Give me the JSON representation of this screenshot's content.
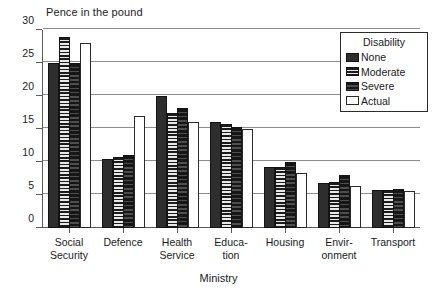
{
  "chart_data": {
    "type": "bar",
    "title": "",
    "ylabel": "Pence in the pound",
    "xlabel": "Ministry",
    "ylim": [
      0,
      30
    ],
    "yticks": [
      0,
      5,
      10,
      15,
      20,
      25,
      30
    ],
    "grid": true,
    "legend_title": "Disability",
    "legend_position": "top-right-inside",
    "categories": [
      "Social Security",
      "Defence",
      "Health Service",
      "Education",
      "Housing",
      "Environment",
      "Transport"
    ],
    "category_lines": [
      [
        "Social",
        "Security"
      ],
      [
        "Defence",
        ""
      ],
      [
        "Health",
        "Service"
      ],
      [
        "Educa-",
        "tion"
      ],
      [
        "Housing",
        ""
      ],
      [
        "Envir-",
        "onment"
      ],
      [
        "Transport",
        ""
      ]
    ],
    "series": [
      {
        "name": "None",
        "values": [
          25.0,
          10.5,
          20.0,
          16.0,
          9.2,
          6.8,
          5.7
        ]
      },
      {
        "name": "Moderate",
        "values": [
          29.0,
          10.8,
          17.5,
          15.7,
          9.2,
          7.0,
          5.8
        ]
      },
      {
        "name": "Severe",
        "values": [
          25.0,
          11.0,
          18.2,
          15.3,
          10.0,
          8.0,
          5.9
        ]
      },
      {
        "name": "Actual",
        "values": [
          28.0,
          17.0,
          16.0,
          15.0,
          8.3,
          6.3,
          5.6
        ]
      }
    ]
  },
  "legend": {
    "title": "Disability",
    "items": [
      {
        "label": "None"
      },
      {
        "label": "Moderate"
      },
      {
        "label": "Severe"
      },
      {
        "label": "Actual"
      }
    ]
  },
  "axes": {
    "y_title": "Pence in the pound",
    "x_title": "Ministry",
    "y_tick_labels": [
      "30",
      "25",
      "20",
      "15",
      "10",
      "5",
      "0"
    ]
  },
  "colors": {
    "series_none": "#2e2e2e",
    "series_moderate": "#bdbdbd",
    "series_severe": "#3a3a3a",
    "series_actual": "#ffffff",
    "axis": "#5a5a5a",
    "grid": "#8d8d8d",
    "text": "#1a1a1a",
    "background": "#ffffff"
  }
}
